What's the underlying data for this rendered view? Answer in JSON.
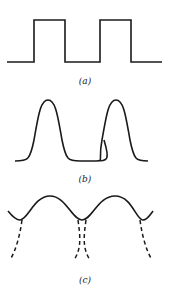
{
  "figure": {
    "panels": [
      {
        "id": "a",
        "label": "(a)",
        "description": "square wave"
      },
      {
        "id": "b",
        "label": "(b)",
        "description": "smooth periodic pulses"
      },
      {
        "id": "c",
        "label": "(c)",
        "description": "periodic curve with dashed branches below minima"
      }
    ],
    "stroke_color": "#1a1a1a"
  }
}
